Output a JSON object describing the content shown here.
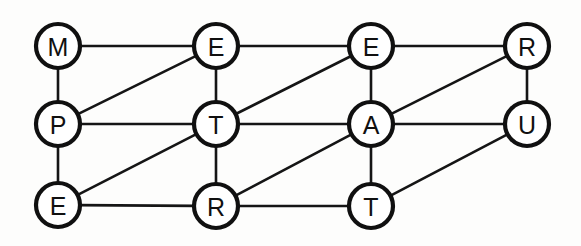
{
  "diagram": {
    "type": "undirected-graph",
    "canvas": {
      "width": 581,
      "height": 246,
      "background": "#fdfdfc"
    },
    "style": {
      "node_fill": "#ffffff",
      "node_stroke": "#101010",
      "node_stroke_width": 4.2,
      "node_radius": 22,
      "edge_stroke": "#151515",
      "edge_stroke_width": 2.6,
      "label_color": "#101010",
      "label_font_size": 25
    },
    "rows": [
      {
        "name": "top-row",
        "word": "METE"
      },
      {
        "name": "middle-row",
        "word": "PTAU"
      },
      {
        "name": "bottom-row",
        "word": "ERT"
      }
    ],
    "nodes": [
      {
        "id": "n0",
        "label": "M",
        "x": 58,
        "y": 46,
        "row": 0,
        "col": 0
      },
      {
        "id": "n1",
        "label": "E",
        "x": 216,
        "y": 46,
        "row": 0,
        "col": 1
      },
      {
        "id": "n2",
        "label": "E",
        "x": 371,
        "y": 46,
        "row": 0,
        "col": 2
      },
      {
        "id": "n3",
        "label": "R",
        "x": 527,
        "y": 46,
        "row": 0,
        "col": 3
      },
      {
        "id": "n4",
        "label": "P",
        "x": 58,
        "y": 124,
        "row": 1,
        "col": 0
      },
      {
        "id": "n5",
        "label": "T",
        "x": 216,
        "y": 124,
        "row": 1,
        "col": 1
      },
      {
        "id": "n6",
        "label": "A",
        "x": 371,
        "y": 124,
        "row": 1,
        "col": 2
      },
      {
        "id": "n7",
        "label": "U",
        "x": 527,
        "y": 124,
        "row": 1,
        "col": 3
      },
      {
        "id": "n8",
        "label": "E",
        "x": 58,
        "y": 205,
        "row": 2,
        "col": 0
      },
      {
        "id": "n9",
        "label": "R",
        "x": 216,
        "y": 206,
        "row": 2,
        "col": 1
      },
      {
        "id": "n10",
        "label": "T",
        "x": 371,
        "y": 206,
        "row": 2,
        "col": 2
      }
    ],
    "edges": [
      {
        "from": "n0",
        "to": "n1",
        "kind": "horizontal"
      },
      {
        "from": "n1",
        "to": "n2",
        "kind": "horizontal"
      },
      {
        "from": "n2",
        "to": "n3",
        "kind": "horizontal"
      },
      {
        "from": "n4",
        "to": "n5",
        "kind": "horizontal"
      },
      {
        "from": "n5",
        "to": "n6",
        "kind": "horizontal"
      },
      {
        "from": "n6",
        "to": "n7",
        "kind": "horizontal"
      },
      {
        "from": "n8",
        "to": "n9",
        "kind": "horizontal"
      },
      {
        "from": "n9",
        "to": "n10",
        "kind": "horizontal"
      },
      {
        "from": "n0",
        "to": "n4",
        "kind": "vertical"
      },
      {
        "from": "n1",
        "to": "n5",
        "kind": "vertical"
      },
      {
        "from": "n2",
        "to": "n6",
        "kind": "vertical"
      },
      {
        "from": "n3",
        "to": "n7",
        "kind": "vertical"
      },
      {
        "from": "n4",
        "to": "n8",
        "kind": "vertical"
      },
      {
        "from": "n5",
        "to": "n9",
        "kind": "vertical"
      },
      {
        "from": "n6",
        "to": "n10",
        "kind": "vertical"
      },
      {
        "from": "n4",
        "to": "n1",
        "kind": "diagonal"
      },
      {
        "from": "n5",
        "to": "n2",
        "kind": "diagonal"
      },
      {
        "from": "n6",
        "to": "n3",
        "kind": "diagonal"
      },
      {
        "from": "n8",
        "to": "n5",
        "kind": "diagonal"
      },
      {
        "from": "n9",
        "to": "n6",
        "kind": "diagonal"
      },
      {
        "from": "n10",
        "to": "n7",
        "kind": "diagonal"
      }
    ]
  }
}
